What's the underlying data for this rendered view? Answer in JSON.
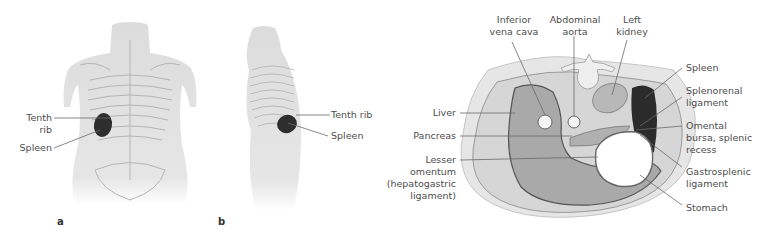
{
  "figure": {
    "panels": [
      {
        "id": "a",
        "letter": "a",
        "view": "posterior view of torso",
        "labels": [
          {
            "key": "tenth_rib",
            "lines": [
              "Tenth",
              "rib"
            ]
          },
          {
            "key": "spleen",
            "lines": [
              "Spleen"
            ]
          }
        ]
      },
      {
        "id": "b",
        "letter": "b",
        "view": "left lateral view of torso",
        "labels": [
          {
            "key": "tenth_rib",
            "lines": [
              "Tenth rib"
            ]
          },
          {
            "key": "spleen",
            "lines": [
              "Spleen"
            ]
          }
        ]
      },
      {
        "id": "c",
        "view": "transverse cross-section of upper abdomen",
        "labels_left": [
          {
            "key": "liver",
            "lines": [
              "Liver"
            ]
          },
          {
            "key": "pancreas",
            "lines": [
              "Pancreas"
            ]
          },
          {
            "key": "lesser_omentum",
            "lines": [
              "Lesser",
              "omentum",
              "(hepatogastric",
              "ligament)"
            ]
          }
        ],
        "labels_top": [
          {
            "key": "ivc",
            "lines": [
              "Inferior",
              "vena cava"
            ]
          },
          {
            "key": "aorta",
            "lines": [
              "Abdominal",
              "aorta"
            ]
          },
          {
            "key": "left_kidney",
            "lines": [
              "Left",
              "kidney"
            ]
          }
        ],
        "labels_right": [
          {
            "key": "spleen",
            "lines": [
              "Spleen"
            ]
          },
          {
            "key": "splenorenal",
            "lines": [
              "Splenorenal",
              "ligament"
            ]
          },
          {
            "key": "omental_bursa",
            "lines": [
              "Omental",
              "bursa, splenic",
              "recess"
            ]
          },
          {
            "key": "gastrosplenic",
            "lines": [
              "Gastrosplenic",
              "ligament"
            ]
          },
          {
            "key": "stomach",
            "lines": [
              "Stomach"
            ]
          }
        ]
      }
    ]
  },
  "text": {
    "a_tenth": "Tenth",
    "a_rib": "rib",
    "a_spleen": "Spleen",
    "a_letter": "a",
    "b_tenth": "Tenth rib",
    "b_spleen": "Spleen",
    "b_letter": "b",
    "ivc_1": "Inferior",
    "ivc_2": "vena cava",
    "aorta_1": "Abdominal",
    "aorta_2": "aorta",
    "kidney_1": "Left",
    "kidney_2": "kidney",
    "liver": "Liver",
    "pancreas": "Pancreas",
    "lo_1": "Lesser",
    "lo_2": "omentum",
    "lo_3": "(hepatogastric",
    "lo_4": "ligament)",
    "spleen": "Spleen",
    "sr_1": "Splenorenal",
    "sr_2": "ligament",
    "ob_1": "Omental",
    "ob_2": "bursa, splenic",
    "ob_3": "recess",
    "gs_1": "Gastrosplenic",
    "gs_2": "ligament",
    "stomach": "Stomach"
  },
  "colors": {
    "body_outline": "#e3e3e3",
    "body_fill": "#d8d8d8",
    "liver": "#a9a9a9",
    "spleen": "#2b2b2b",
    "kidney": "#b8b8b8",
    "pancreas": "#b0b0b0",
    "stomach_lumen": "#ffffff",
    "leader_line": "#6b6b6b"
  }
}
